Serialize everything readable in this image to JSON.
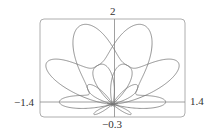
{
  "chart_data": {
    "type": "line",
    "title": "",
    "curve": "r = sin(θ) + sin³(5θ/2)",
    "theta_range": [
      0,
      12.566
    ],
    "xlim": [
      -1.4,
      1.4
    ],
    "ylim": [
      -0.3,
      2
    ],
    "tick_labels": {
      "top": "2",
      "bottom": "−0.3",
      "left": "−1.4",
      "right": "1.4"
    },
    "grid": false,
    "stroke_color": "#777777",
    "frame_color": "#999999"
  }
}
